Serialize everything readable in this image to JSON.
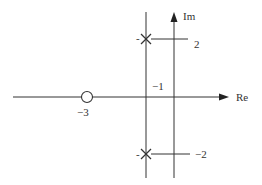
{
  "diagram": {
    "type": "pole-zero-plot",
    "axes": {
      "real_label": "Re",
      "imag_label": "Im"
    },
    "poles": [
      {
        "re": -1,
        "im": 2,
        "marker": "×"
      },
      {
        "re": -1,
        "im": -2,
        "marker": "×"
      }
    ],
    "zeros": [
      {
        "re": -3,
        "im": 0,
        "marker": "○"
      }
    ],
    "labels": {
      "zero_label": "−3",
      "vline_label": "−1",
      "top_im_label": "2",
      "bottom_im_label": "−2",
      "top_dash": "-",
      "bottom_dash": "-"
    },
    "colors": {
      "line": "#333333",
      "background": "#ffffff"
    }
  }
}
